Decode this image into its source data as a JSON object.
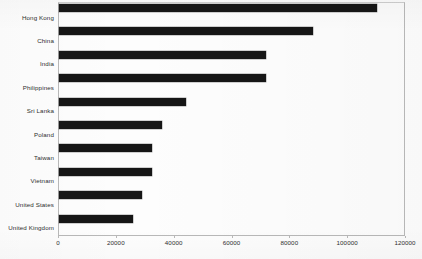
{
  "chart_data": {
    "type": "bar",
    "orientation": "horizontal",
    "title": "",
    "subtitle": "",
    "xlabel": "",
    "ylabel": "",
    "categories": [
      "Hong Kong",
      "China",
      "India",
      "Philippines",
      "Sri Lanka",
      "Poland",
      "Taiwan",
      "Vietnam",
      "United States",
      "United Kingdom"
    ],
    "values": [
      110000,
      88000,
      71500,
      71500,
      44000,
      35500,
      32000,
      32000,
      28700,
      25500
    ],
    "xlim": [
      0,
      120000
    ],
    "xticks": [
      0,
      20000,
      40000,
      60000,
      80000,
      100000,
      120000
    ],
    "xtick_labels": [
      "0",
      "20000",
      "40000",
      "60000",
      "80000",
      "100000",
      "120000"
    ],
    "grid": false,
    "legend": null,
    "bar_color": "#161616",
    "axis_color": "#b9b9b9",
    "background_color": "#fdfdfd",
    "text_color": "#2e2e2e"
  }
}
